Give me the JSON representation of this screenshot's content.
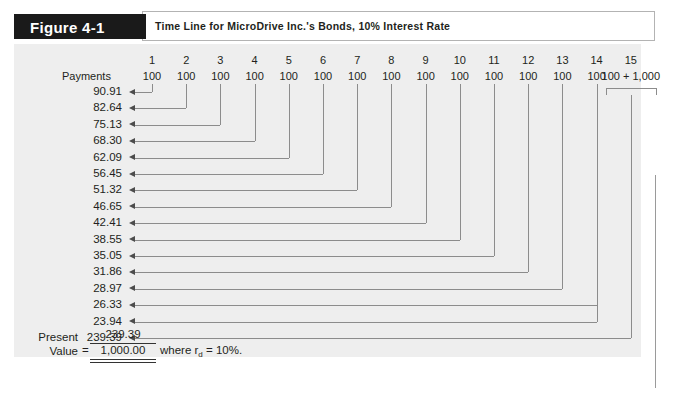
{
  "figure": {
    "tab_label": "Figure 4-1",
    "title": "Time Line for MicroDrive Inc.'s Bonds, 10% Interest Rate"
  },
  "timeline": {
    "payments_label": "Payments",
    "periods": [
      "1",
      "2",
      "3",
      "4",
      "5",
      "6",
      "7",
      "8",
      "9",
      "10",
      "11",
      "12",
      "13",
      "14",
      "15"
    ],
    "payments": [
      "100",
      "100",
      "100",
      "100",
      "100",
      "100",
      "100",
      "100",
      "100",
      "100",
      "100",
      "100",
      "100",
      "100",
      "100 + 1,000"
    ],
    "final_period_payment_coupon": "100",
    "final_period_payment_principal": "1,000",
    "final_period_plus": "+"
  },
  "present_values": [
    {
      "value": "90.91",
      "from_period": 1
    },
    {
      "value": "82.64",
      "from_period": 2
    },
    {
      "value": "75.13",
      "from_period": 3
    },
    {
      "value": "68.30",
      "from_period": 4
    },
    {
      "value": "62.09",
      "from_period": 5
    },
    {
      "value": "56.45",
      "from_period": 6
    },
    {
      "value": "51.32",
      "from_period": 7
    },
    {
      "value": "46.65",
      "from_period": 8
    },
    {
      "value": "42.41",
      "from_period": 9
    },
    {
      "value": "38.55",
      "from_period": 10
    },
    {
      "value": "35.05",
      "from_period": 11
    },
    {
      "value": "31.86",
      "from_period": 12
    },
    {
      "value": "28.97",
      "from_period": 13
    },
    {
      "value": "26.33",
      "from_period": 14
    },
    {
      "value": "23.94",
      "from_period": 14
    },
    {
      "value": "239.39",
      "from_period": 15
    }
  ],
  "present_value_block": {
    "label_line1": "Present",
    "label_line2": "Value",
    "equals": "=",
    "numerator": "239.39",
    "total": "1,000.00",
    "note_prefix": "where r",
    "note_subscript": "d",
    "note_suffix": " = 10%."
  },
  "chart_data": {
    "type": "table",
    "title": "Time Line for MicroDrive Inc.'s Bonds, 10% Interest Rate",
    "xlabel": "Period",
    "ylabel": "Cash Flow / Present Value",
    "categories": [
      "1",
      "2",
      "3",
      "4",
      "5",
      "6",
      "7",
      "8",
      "9",
      "10",
      "11",
      "12",
      "13",
      "14",
      "15"
    ],
    "series": [
      {
        "name": "Payments",
        "values": [
          100,
          100,
          100,
          100,
          100,
          100,
          100,
          100,
          100,
          100,
          100,
          100,
          100,
          100,
          1100
        ]
      },
      {
        "name": "Present Value of Coupon",
        "values": [
          90.91,
          82.64,
          75.13,
          68.3,
          62.09,
          56.45,
          51.32,
          46.65,
          42.41,
          38.55,
          35.05,
          31.86,
          28.97,
          26.33,
          23.94
        ]
      }
    ],
    "annotations": [
      "Present value of period-15 cash flow (100 + 1,000) = 239.39",
      "Sum of present values = 1,000.00",
      "Discount rate rd = 10%"
    ],
    "grid": false,
    "legend": "none"
  },
  "colors": {
    "tab_background": "#1a1a1a",
    "tab_text": "#ffffff",
    "panel_background": "#eeeeee",
    "line": "#8c8c8c",
    "text": "#231f20",
    "border": "#b3b3b3"
  }
}
